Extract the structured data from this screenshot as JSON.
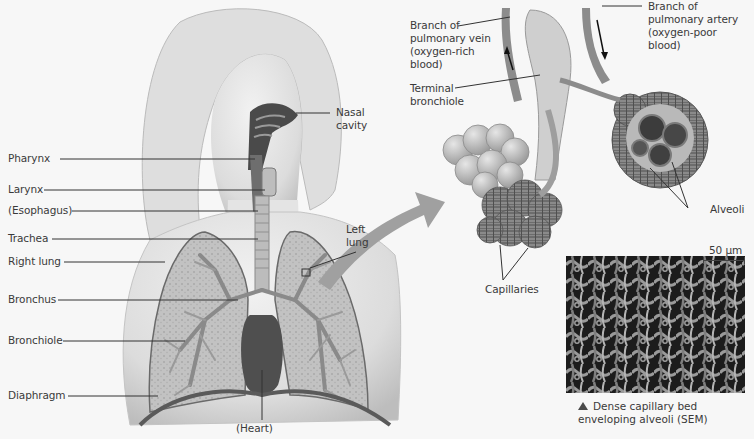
{
  "diagram": {
    "palette": {
      "background": "#f7f7f7",
      "skin": "#e2e2e2",
      "skin_shadow": "#c9c9c9",
      "lung_fill": "#b9b9b9",
      "bronchi": "#8e8e8e",
      "heart": "#4d4d4d",
      "arrow": "#9a9a9a",
      "label_text": "#3a3a3a",
      "leader_line": "#333333"
    },
    "body_labels": {
      "nasal_cavity": "Nasal\ncavity",
      "pharynx": "Pharynx",
      "larynx": "Larynx",
      "esophagus": "(Esophagus)",
      "trachea": "Trachea",
      "right_lung": "Right lung",
      "bronchus": "Bronchus",
      "bronchiole": "Bronchiole",
      "diaphragm": "Diaphragm",
      "heart": "(Heart)",
      "left_lung": "Left\nlung"
    },
    "detail_labels": {
      "pulmonary_vein": "Branch of\npulmonary vein\n(oxygen-rich\nblood)",
      "pulmonary_artery": "Branch of\npulmonary artery\n(oxygen-poor\nblood)",
      "terminal_bronchiole": "Terminal\nbronchiole",
      "alveoli": "Alveoli",
      "capillaries": "Capillaries"
    },
    "micrograph": {
      "scale_bar": "50 µm",
      "caption": "Dense capillary bed\nenveloping alveoli (SEM)",
      "caption_marker": "triangle-up"
    }
  }
}
